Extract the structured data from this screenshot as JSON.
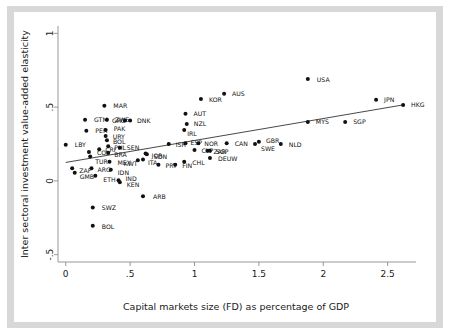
{
  "chart_data": {
    "type": "scatter",
    "title": "",
    "xlabel": "Capital markets size (FD) as percentage of GDP",
    "ylabel": "Inter sectoral investment value-added elasticity",
    "xlim": [
      -0.06,
      2.72
    ],
    "ylim": [
      -0.55,
      1.05
    ],
    "xticks": [
      0,
      0.5,
      1,
      1.5,
      2,
      2.5
    ],
    "xticklabels": [
      "0",
      ".5",
      "1",
      "1.5",
      "2",
      "2.5"
    ],
    "yticks": [
      1,
      0.5,
      0,
      -0.5
    ],
    "yticklabels": [
      "1",
      ".5",
      "0",
      "-.5"
    ],
    "grid": false,
    "legend": null,
    "marker_color": "#111111",
    "fitline_color": "#333333",
    "axis_color": "#8c8c8c",
    "fit_line": {
      "x0": 0.0,
      "y0": 0.125,
      "x1": 2.62,
      "y1": 0.515
    },
    "points": [
      {
        "label": "LBY",
        "x": 0.0,
        "y": 0.245,
        "lx": 9,
        "ly": 2.5
      },
      {
        "label": "ZAF",
        "x": 0.05,
        "y": 0.085,
        "lx": 7,
        "ly": 4.5
      },
      {
        "label": "GMB",
        "x": 0.07,
        "y": 0.055,
        "lx": 5,
        "ly": 6.5
      },
      {
        "label": "GTM",
        "x": 0.15,
        "y": 0.415,
        "lx": 9,
        "ly": 2.5
      },
      {
        "label": "PER",
        "x": 0.16,
        "y": 0.34,
        "lx": 9,
        "ly": 2.5
      },
      {
        "label": "COL",
        "x": 0.18,
        "y": 0.195,
        "lx": 8,
        "ly": 2.5
      },
      {
        "label": "TUR",
        "x": 0.19,
        "y": 0.165,
        "lx": 5,
        "ly": 7.0
      },
      {
        "label": "ARG",
        "x": 0.2,
        "y": 0.085,
        "lx": 6,
        "ly": 4.0
      },
      {
        "label": "SWZ",
        "x": 0.21,
        "y": -0.18,
        "lx": 9,
        "ly": 3.0
      },
      {
        "label": "BOL",
        "x": 0.21,
        "y": -0.305,
        "lx": 9,
        "ly": 3.0
      },
      {
        "label": "ETH",
        "x": 0.23,
        "y": 0.035,
        "lx": 8,
        "ly": 6.5
      },
      {
        "label": "CRI",
        "x": 0.26,
        "y": 0.215,
        "lx": 6,
        "ly": 3.0
      },
      {
        "label": "MAR",
        "x": 0.3,
        "y": 0.51,
        "lx": 9,
        "ly": 2.5
      },
      {
        "label": "PAK",
        "x": 0.31,
        "y": 0.345,
        "lx": 8,
        "ly": 1.5
      },
      {
        "label": "URY",
        "x": 0.31,
        "y": 0.305,
        "lx": 7,
        "ly": 3.5
      },
      {
        "label": "BOL2",
        "x": 0.32,
        "y": 0.275,
        "lx": 6,
        "ly": 4.0
      },
      {
        "label": "ZWE",
        "x": 0.32,
        "y": 0.415,
        "lx": 8,
        "ly": 2.5
      },
      {
        "label": "PHL",
        "x": 0.33,
        "y": 0.235,
        "lx": 6,
        "ly": 3.5
      },
      {
        "label": "BRA",
        "x": 0.33,
        "y": 0.19,
        "lx": 6,
        "ly": 4.0
      },
      {
        "label": "MEX",
        "x": 0.34,
        "y": 0.13,
        "lx": 8,
        "ly": 3.0
      },
      {
        "label": "IDN",
        "x": 0.35,
        "y": 0.075,
        "lx": 7,
        "ly": 5.0
      },
      {
        "label": "GRC",
        "x": 0.46,
        "y": 0.41,
        "lx": -13,
        "ly": 2.5
      },
      {
        "label": "DNK",
        "x": 0.5,
        "y": 0.41,
        "lx": 7,
        "ly": 2.5
      },
      {
        "label": "SEN",
        "x": 0.42,
        "y": 0.225,
        "lx": 7,
        "ly": 2.0
      },
      {
        "label": "IND",
        "x": 0.41,
        "y": 0.005,
        "lx": 7,
        "ly": 1.0
      },
      {
        "label": "KEN",
        "x": 0.42,
        "y": -0.01,
        "lx": 7,
        "ly": 5.0
      },
      {
        "label": "KWT",
        "x": 0.56,
        "y": 0.14,
        "lx": -14,
        "ly": 6.0
      },
      {
        "label": "ITA",
        "x": 0.6,
        "y": 0.145,
        "lx": 5,
        "ly": 6.0
      },
      {
        "label": "ARB",
        "x": 0.6,
        "y": -0.105,
        "lx": 10,
        "ly": 3.0
      },
      {
        "label": "JOR",
        "x": 0.62,
        "y": 0.185,
        "lx": 6,
        "ly": 4.5
      },
      {
        "label": "SDN",
        "x": 0.63,
        "y": 0.18,
        "lx": 7,
        "ly": 5.0
      },
      {
        "label": "PRT",
        "x": 0.72,
        "y": 0.11,
        "lx": 7,
        "ly": 3.0
      },
      {
        "label": "ISR",
        "x": 0.8,
        "y": 0.25,
        "lx": 7,
        "ly": 2.5
      },
      {
        "label": "FIN",
        "x": 0.85,
        "y": 0.11,
        "lx": 7,
        "ly": 3.5
      },
      {
        "label": "CHL",
        "x": 0.92,
        "y": 0.13,
        "lx": 8,
        "ly": 3.0
      },
      {
        "label": "AUT",
        "x": 0.93,
        "y": 0.455,
        "lx": 8,
        "ly": 2.5
      },
      {
        "label": "NZL",
        "x": 0.94,
        "y": 0.385,
        "lx": 7,
        "ly": 1.5
      },
      {
        "label": "IRL",
        "x": 0.92,
        "y": 0.345,
        "lx": 3,
        "ly": 6.5
      },
      {
        "label": "ESP",
        "x": 0.93,
        "y": 0.255,
        "lx": 5,
        "ly": 2.0
      },
      {
        "label": "KOR",
        "x": 1.05,
        "y": 0.555,
        "lx": 8,
        "ly": 2.5
      },
      {
        "label": "NOR",
        "x": 1.03,
        "y": 0.255,
        "lx": 6,
        "ly": 2.5
      },
      {
        "label": "CYP",
        "x": 1.0,
        "y": 0.21,
        "lx": 7,
        "ly": 3.0
      },
      {
        "label": "ZAR",
        "x": 1.1,
        "y": 0.205,
        "lx": 6,
        "ly": 3.0
      },
      {
        "label": "SGP2",
        "x": 1.12,
        "y": 0.205,
        "lx": 6,
        "ly": 3.0
      },
      {
        "label": "DEUW",
        "x": 1.12,
        "y": 0.155,
        "lx": 8,
        "ly": 3.0
      },
      {
        "label": "AUS",
        "x": 1.23,
        "y": 0.59,
        "lx": 8,
        "ly": 2.5
      },
      {
        "label": "CAN",
        "x": 1.25,
        "y": 0.255,
        "lx": 8,
        "ly": 2.5
      },
      {
        "label": "SWE",
        "x": 1.47,
        "y": 0.25,
        "lx": 6,
        "ly": 6.5
      },
      {
        "label": "GBR",
        "x": 1.5,
        "y": 0.265,
        "lx": 7,
        "ly": 1.5
      },
      {
        "label": "NLD",
        "x": 1.67,
        "y": 0.25,
        "lx": 8,
        "ly": 2.5
      },
      {
        "label": "MYS",
        "x": 1.88,
        "y": 0.4,
        "lx": 8,
        "ly": 2.5
      },
      {
        "label": "USA",
        "x": 1.88,
        "y": 0.69,
        "lx": 9,
        "ly": 2.5
      },
      {
        "label": "SGP",
        "x": 2.17,
        "y": 0.4,
        "lx": 8,
        "ly": 2.5
      },
      {
        "label": "JPN",
        "x": 2.41,
        "y": 0.55,
        "lx": 8,
        "ly": 2.5
      },
      {
        "label": "HKG",
        "x": 2.62,
        "y": 0.515,
        "lx": 8,
        "ly": 2.5
      }
    ]
  }
}
